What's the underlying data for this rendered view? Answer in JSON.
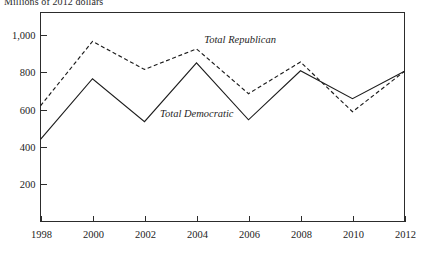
{
  "axis_title": "Millions of 2012 dollars",
  "chart_data": {
    "type": "line",
    "title": "",
    "subtitle": "",
    "xlabel": "",
    "ylabel": "Millions of 2012 dollars",
    "x": [
      1998,
      2000,
      2002,
      2004,
      2006,
      2008,
      2010,
      2012
    ],
    "categories": [
      "1998",
      "2000",
      "2002",
      "2004",
      "2006",
      "2008",
      "2010",
      "2012"
    ],
    "xtick_labels": [
      "1998",
      "2000",
      "2002",
      "2004",
      "2006",
      "2008",
      "2010",
      "2012"
    ],
    "ytick_labels": [
      "1,000",
      "800",
      "600",
      "400",
      "200"
    ],
    "ytick_values": [
      1000,
      800,
      600,
      400,
      200
    ],
    "xlim": [
      1998,
      2012
    ],
    "ylim": [
      0,
      1120
    ],
    "grid": false,
    "legend_position": "inline-annotation",
    "series": [
      {
        "name": "Total Republican",
        "style": "dashed",
        "label": "Total Republican",
        "values": [
          620,
          965,
          815,
          925,
          685,
          855,
          588,
          805
        ]
      },
      {
        "name": "Total Democratic",
        "style": "solid",
        "label": "Total Democratic",
        "values": [
          440,
          765,
          535,
          850,
          545,
          808,
          658,
          805
        ]
      }
    ],
    "annotations": [
      {
        "text": "Total Republican",
        "x": 2004.3,
        "y": 955
      },
      {
        "text": "Total Democratic",
        "x": 2002.6,
        "y": 560
      }
    ]
  }
}
